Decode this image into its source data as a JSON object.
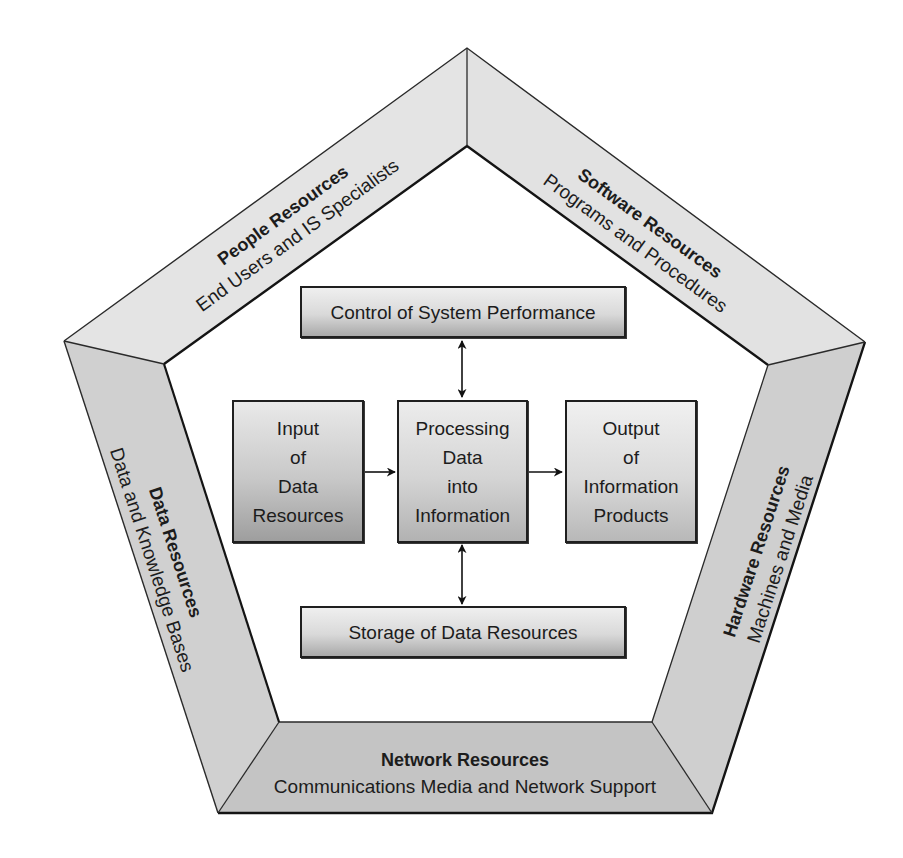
{
  "diagram": {
    "bands": {
      "people": {
        "title": "People Resources",
        "subtitle": "End Users and IS Specialists"
      },
      "software": {
        "title": "Software Resources",
        "subtitle": "Programs and Procedures"
      },
      "hardware": {
        "title": "Hardware Resources",
        "subtitle": "Machines and Media"
      },
      "network": {
        "title": "Network Resources",
        "subtitle": "Communications Media and Network Support"
      },
      "data": {
        "title": "Data Resources",
        "subtitle": "Data and Knowledge Bases"
      }
    },
    "boxes": {
      "control": {
        "label": "Control of System Performance"
      },
      "input": {
        "lines": [
          "Input",
          "of",
          "Data",
          "Resources"
        ]
      },
      "processing": {
        "lines": [
          "Processing",
          "Data",
          "into",
          "Information"
        ]
      },
      "output": {
        "lines": [
          "Output",
          "of",
          "Information",
          "Products"
        ]
      },
      "storage": {
        "label": "Storage of Data Resources"
      }
    },
    "colors": {
      "band_light": "#e2e2e2",
      "band_mid": "#d2d2d2",
      "band_dark": "#c2c2c2",
      "stroke": "#1f1f1f"
    }
  }
}
